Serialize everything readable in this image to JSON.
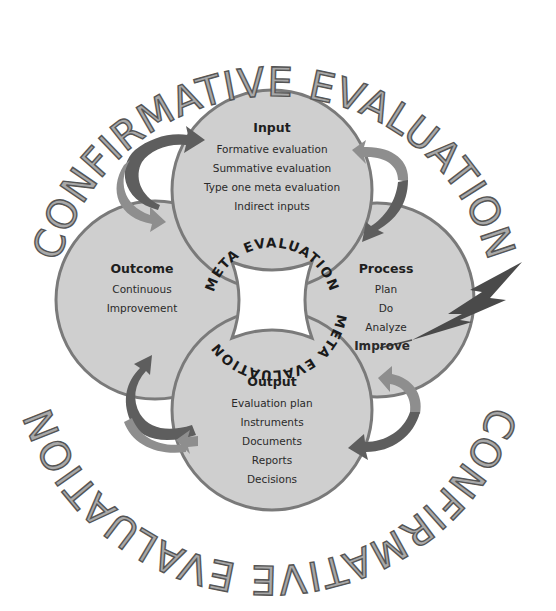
{
  "diagram": {
    "outer_ring": {
      "top_label": "CONFIRMATIVE EVALUATION",
      "bottom_label": "CONFIRMATIVE EVALUATION"
    },
    "inner_ring": {
      "upper_label": "META EVALUATION",
      "lower_label": "META EVALUATION"
    },
    "nodes": {
      "input": {
        "title": "Input",
        "items": [
          "Formative evaluation",
          "Summative evaluation",
          "Type one meta evaluation",
          "Indirect inputs"
        ]
      },
      "process": {
        "title": "Process",
        "items": [
          "Plan",
          "Do",
          "Analyze"
        ],
        "highlight": "Improve"
      },
      "output": {
        "title": "Output",
        "items": [
          "Evaluation plan",
          "Instruments",
          "Documents",
          "Reports",
          "Decisions"
        ]
      },
      "outcome": {
        "title": "Outcome",
        "items": [
          "Continuous",
          "Improvement"
        ]
      }
    },
    "icons": {
      "cycle_arrows": "curved-arrow-icon",
      "lightning": "lightning-bolt-icon"
    },
    "colors": {
      "circle_fill": "#cfcfcf",
      "circle_stroke": "#7a7a7a",
      "arrow_dark": "#5e5e5e",
      "arrow_light": "#8e8e8e",
      "outer_text_fill": "#a8a8a8",
      "lightning": "#4a4a4a"
    }
  }
}
